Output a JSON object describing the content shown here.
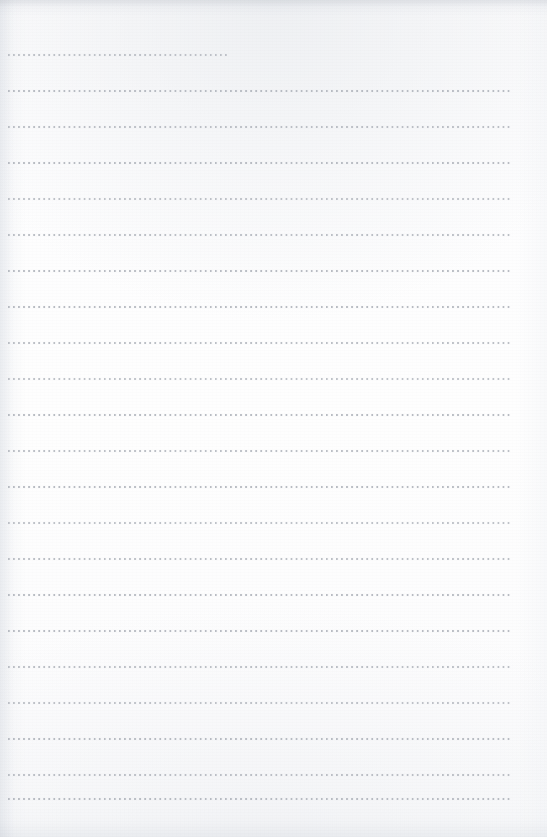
{
  "document": {
    "kind": "scanned-page",
    "page_type": "dotted-rule-notebook-page",
    "content_text": "",
    "handwriting_present": "none",
    "page_width_px": 547,
    "page_height_px": 837
  },
  "paper": {
    "background_color": "#fdfdfe",
    "edge_shadow_color": "#d6d9de",
    "grain_present": "yes"
  },
  "ruling": {
    "style": "dotted",
    "dot_color": "#b4b8bf",
    "dot_size_px": 2,
    "dot_pitch_px": 5,
    "line_spacing_px": 36,
    "first_line_top_px": 54,
    "left_margin_px": 8,
    "right_edge_px": 512,
    "line_count": 21,
    "lines": [
      {
        "index": 1,
        "top": 54,
        "left": 8,
        "right": 227,
        "tone": "v1"
      },
      {
        "index": 2,
        "top": 90,
        "left": 8,
        "right": 512,
        "tone": "v2"
      },
      {
        "index": 3,
        "top": 126,
        "left": 8,
        "right": 512,
        "tone": "v3"
      },
      {
        "index": 4,
        "top": 162,
        "left": 8,
        "right": 512,
        "tone": "v2"
      },
      {
        "index": 5,
        "top": 198,
        "left": 8,
        "right": 512,
        "tone": "v1"
      },
      {
        "index": 6,
        "top": 234,
        "left": 8,
        "right": 512,
        "tone": "v3"
      },
      {
        "index": 7,
        "top": 270,
        "left": 8,
        "right": 512,
        "tone": "v2"
      },
      {
        "index": 8,
        "top": 306,
        "left": 8,
        "right": 512,
        "tone": "v2"
      },
      {
        "index": 9,
        "top": 342,
        "left": 8,
        "right": 512,
        "tone": "v3"
      },
      {
        "index": 10,
        "top": 378,
        "left": 8,
        "right": 512,
        "tone": "v1"
      },
      {
        "index": 11,
        "top": 414,
        "left": 8,
        "right": 512,
        "tone": "v2"
      },
      {
        "index": 12,
        "top": 450,
        "left": 8,
        "right": 512,
        "tone": "v3"
      },
      {
        "index": 13,
        "top": 486,
        "left": 8,
        "right": 512,
        "tone": "v2"
      },
      {
        "index": 14,
        "top": 522,
        "left": 8,
        "right": 512,
        "tone": "v1"
      },
      {
        "index": 15,
        "top": 558,
        "left": 8,
        "right": 512,
        "tone": "v3"
      },
      {
        "index": 16,
        "top": 594,
        "left": 8,
        "right": 512,
        "tone": "v2"
      },
      {
        "index": 17,
        "top": 630,
        "left": 8,
        "right": 512,
        "tone": "v2"
      },
      {
        "index": 18,
        "top": 666,
        "left": 8,
        "right": 512,
        "tone": "v3"
      },
      {
        "index": 19,
        "top": 702,
        "left": 8,
        "right": 512,
        "tone": "v1"
      },
      {
        "index": 20,
        "top": 738,
        "left": 8,
        "right": 512,
        "tone": "v2"
      },
      {
        "index": 21,
        "top": 774,
        "left": 8,
        "right": 512,
        "tone": "v3"
      },
      {
        "index": 22,
        "top": 798,
        "left": 8,
        "right": 512,
        "tone": "v2"
      }
    ]
  }
}
